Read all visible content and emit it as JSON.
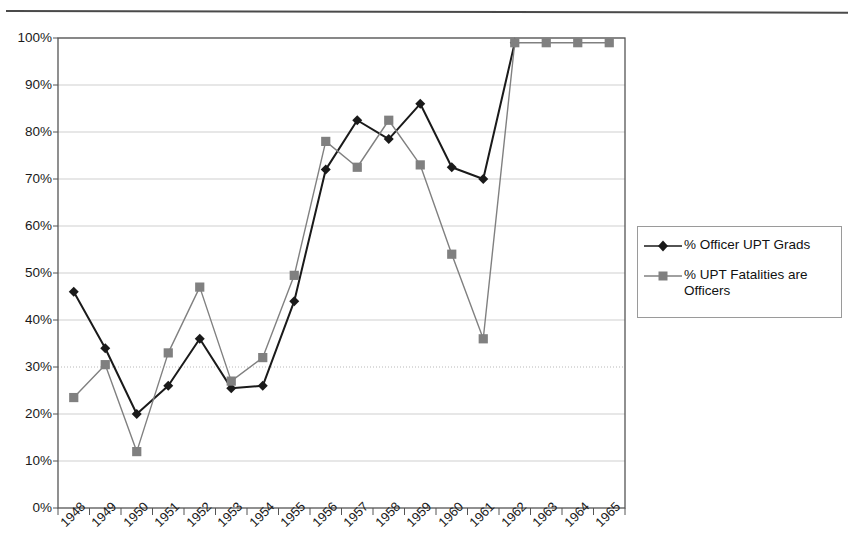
{
  "chart_data": {
    "type": "line",
    "title": "",
    "xlabel": "",
    "ylabel": "",
    "categories": [
      "1948",
      "1949",
      "1950",
      "1951",
      "1952",
      "1953",
      "1954",
      "1955",
      "1956",
      "1957",
      "1958",
      "1959",
      "1960",
      "1961",
      "1962",
      "1963",
      "1964",
      "1965"
    ],
    "ylim": [
      0,
      100
    ],
    "ytick_labels": [
      "0%",
      "10%",
      "20%",
      "30%",
      "40%",
      "50%",
      "60%",
      "70%",
      "80%",
      "90%",
      "100%"
    ],
    "ytick_values": [
      0,
      10,
      20,
      30,
      40,
      50,
      60,
      70,
      80,
      90,
      100
    ],
    "grid": true,
    "legend_position": "right",
    "series": [
      {
        "name": "% Officer UPT Grads",
        "color": "#1a1a1a",
        "marker": "diamond",
        "values": [
          46,
          34,
          20,
          26,
          36,
          25.5,
          26,
          44,
          72,
          82.5,
          78.5,
          86,
          72.5,
          70,
          99,
          null,
          null,
          null
        ]
      },
      {
        "name": "% UPT Fatalities are Officers",
        "color": "#808080",
        "marker": "square",
        "values": [
          23.5,
          30.5,
          12,
          33,
          47,
          27,
          32,
          49.5,
          78,
          72.5,
          82.5,
          73,
          54,
          36,
          99,
          99,
          99,
          99
        ]
      }
    ]
  },
  "legend": {
    "items": [
      {
        "label": "% Officer UPT Grads",
        "marker": "diamond",
        "color": "#1a1a1a"
      },
      {
        "label": "% UPT Fatalities are Officers",
        "marker": "square",
        "color": "#808080"
      }
    ]
  },
  "colors": {
    "series_1": "#1a1a1a",
    "series_2": "#808080",
    "axis": "#555555",
    "grid": "#cfcfcf",
    "grid_dotted": "#b8b8b8",
    "background": "#ffffff",
    "rule": "#4a4a4a"
  }
}
